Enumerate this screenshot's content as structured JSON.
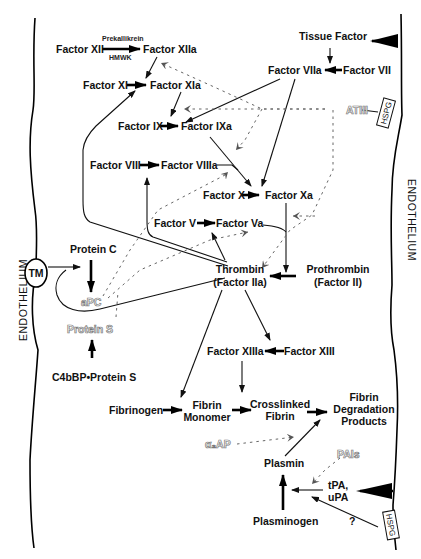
{
  "diagram": {
    "walls": {
      "left_label": "ENDOTHELIUM",
      "right_label": "ENDOTHELIUM"
    },
    "nodes": {
      "factor_xii": "Factor XII",
      "factor_xiia": "Factor XIIa",
      "prekallikrein": "Prekallikrein",
      "hmwk": "HMWK",
      "tissue_factor": "Tissue Factor",
      "factor_viia": "Factor VIIa",
      "factor_vii": "Factor VII",
      "factor_xi": "Factor XI",
      "factor_xia": "Factor XIa",
      "atiii": "ATIII",
      "hspg_top": "HSPG",
      "factor_ix": "Factor IX",
      "factor_ixa": "Factor IXa",
      "factor_viii": "Factor VIII",
      "factor_viiia": "Factor VIIIa",
      "factor_x": "Factor X",
      "factor_xa": "Factor Xa",
      "factor_v": "Factor V",
      "factor_va": "Factor Va",
      "tm": "TM",
      "protein_c": "Protein C",
      "apc": "aPC",
      "protein_s": "Protein S",
      "c4bbp_protein_s": "C4bBP•Protein S",
      "thrombin_line1": "Thrombin",
      "thrombin_line2": "(Factor IIa)",
      "prothrombin_line1": "Prothrombin",
      "prothrombin_line2": "(Factor II)",
      "factor_xiiia": "Factor XIIIa",
      "factor_xiii": "Factor XIII",
      "fibrinogen": "Fibrinogen",
      "fibrin_monomer_line1": "Fibrin",
      "fibrin_monomer_line2": "Monomer",
      "crosslinked_line1": "Crosslinked",
      "crosslinked_line2": "Fibrin",
      "fdp_line1": "Fibrin",
      "fdp_line2": "Degradation",
      "fdp_line3": "Products",
      "alpha2ap": "α₂AP",
      "plasmin": "Plasmin",
      "pais": "PAIs",
      "tpa_line1": "tPA,",
      "tpa_line2": "uPA",
      "plasminogen": "Plasminogen",
      "question": "?",
      "hspg_bottom": "HSPG"
    },
    "colors": {
      "line": "#111111",
      "inhibitor_text": "#777777",
      "background": "#ffffff"
    }
  }
}
